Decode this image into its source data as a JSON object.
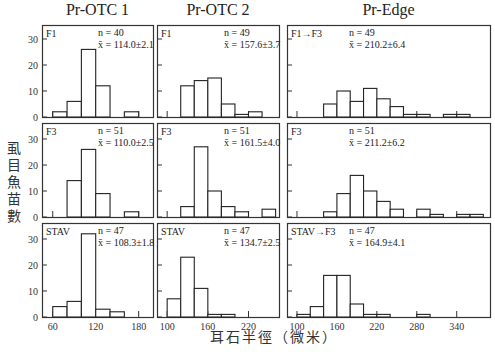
{
  "chart_data": {
    "type": "bar",
    "subtype": "histogram-grid",
    "xlabel": "耳石半徑（微米）",
    "ylabel": "虱目魚苗數",
    "ylim": [
      0,
      35
    ],
    "yticks": [
      0,
      10,
      20,
      30
    ],
    "columns": [
      {
        "title": "Pr-OTC 1",
        "xlim": [
          45,
          200
        ],
        "xticks": [
          60,
          120,
          180
        ]
      },
      {
        "title": "Pr-OTC 2",
        "xlim": [
          85,
          265
        ],
        "xticks": [
          100,
          160,
          220
        ]
      },
      {
        "title": "Pr-Edge",
        "xlim": [
          85,
          390
        ],
        "xticks": [
          100,
          160,
          220,
          280,
          340
        ]
      }
    ],
    "panels": [
      {
        "row": 0,
        "col": 0,
        "label": "F1",
        "n": "n = 40",
        "mean": "x̄ = 114.0±2.1",
        "bins": [
          [
            60,
            80,
            2
          ],
          [
            80,
            100,
            6
          ],
          [
            100,
            120,
            26
          ],
          [
            120,
            140,
            12
          ],
          [
            160,
            180,
            2
          ]
        ]
      },
      {
        "row": 0,
        "col": 1,
        "label": "F1",
        "n": "n = 49",
        "mean": "x̄ = 157.6±3.7",
        "bins": [
          [
            120,
            140,
            12
          ],
          [
            140,
            160,
            14
          ],
          [
            160,
            180,
            15
          ],
          [
            180,
            200,
            5
          ],
          [
            200,
            220,
            1
          ],
          [
            220,
            240,
            2
          ]
        ]
      },
      {
        "row": 0,
        "col": 2,
        "label": "F1→F3",
        "n": "n = 49",
        "mean": "x̄ = 210.2±6.4",
        "bins": [
          [
            140,
            160,
            5
          ],
          [
            160,
            180,
            10
          ],
          [
            180,
            200,
            6
          ],
          [
            200,
            220,
            11
          ],
          [
            220,
            240,
            7
          ],
          [
            240,
            260,
            4
          ],
          [
            260,
            280,
            1
          ],
          [
            280,
            300,
            1
          ],
          [
            320,
            340,
            1
          ],
          [
            340,
            360,
            1
          ]
        ]
      },
      {
        "row": 1,
        "col": 0,
        "label": "F3",
        "n": "n = 51",
        "mean": "x̄ = 110.0±2.5",
        "bins": [
          [
            80,
            100,
            14
          ],
          [
            100,
            120,
            26
          ],
          [
            120,
            140,
            9
          ],
          [
            160,
            180,
            2
          ]
        ]
      },
      {
        "row": 1,
        "col": 1,
        "label": "F3",
        "n": "n = 51",
        "mean": "x̄ = 161.5±4.0",
        "bins": [
          [
            120,
            140,
            4
          ],
          [
            140,
            160,
            27
          ],
          [
            160,
            180,
            10
          ],
          [
            180,
            200,
            4
          ],
          [
            200,
            220,
            2
          ],
          [
            240,
            260,
            3
          ]
        ]
      },
      {
        "row": 1,
        "col": 2,
        "label": "F3",
        "n": "n = 51",
        "mean": "x̄ = 211.2±6.2",
        "bins": [
          [
            140,
            160,
            2
          ],
          [
            160,
            180,
            9
          ],
          [
            180,
            200,
            16
          ],
          [
            200,
            220,
            10
          ],
          [
            220,
            240,
            6
          ],
          [
            240,
            260,
            3
          ],
          [
            280,
            300,
            3
          ],
          [
            300,
            320,
            1
          ],
          [
            340,
            360,
            1
          ],
          [
            360,
            380,
            1
          ]
        ]
      },
      {
        "row": 2,
        "col": 0,
        "label": "STAV",
        "n": "n = 47",
        "mean": "x̄ = 108.3±1.8",
        "bins": [
          [
            60,
            80,
            4
          ],
          [
            80,
            100,
            6
          ],
          [
            100,
            120,
            32
          ],
          [
            120,
            140,
            3
          ],
          [
            140,
            160,
            2
          ]
        ]
      },
      {
        "row": 2,
        "col": 1,
        "label": "STAV",
        "n": "n = 47",
        "mean": "x̄ = 134.7±2.5",
        "bins": [
          [
            100,
            120,
            7
          ],
          [
            120,
            140,
            23
          ],
          [
            140,
            160,
            11
          ],
          [
            160,
            180,
            1
          ],
          [
            180,
            200,
            1
          ]
        ]
      },
      {
        "row": 2,
        "col": 2,
        "label": "STAV→F3",
        "n": "n = 47",
        "mean": "x̄ = 164.9±4.1",
        "bins": [
          [
            100,
            120,
            1
          ],
          [
            120,
            140,
            4
          ],
          [
            140,
            160,
            16
          ],
          [
            160,
            180,
            16
          ],
          [
            180,
            200,
            5
          ],
          [
            200,
            220,
            1
          ],
          [
            220,
            240,
            1
          ],
          [
            280,
            300,
            1
          ]
        ]
      }
    ]
  }
}
